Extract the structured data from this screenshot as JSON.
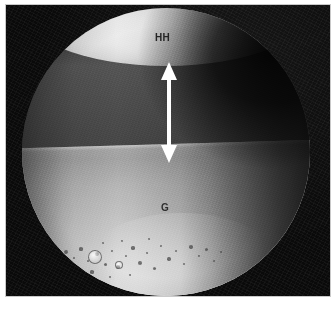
{
  "figure": {
    "type": "micrograph",
    "background_color": "#ffffff",
    "plate_color": "#0a0a0a",
    "frame_border_color": "#c9c9c9"
  },
  "field_of_view": {
    "shape": "circle",
    "center_x": 160,
    "center_y": 147,
    "diameter": 288
  },
  "labels": [
    {
      "id": "hh",
      "text": "HH",
      "x": 149,
      "y": 27,
      "color": "#242424",
      "region": "bright upper layer"
    },
    {
      "id": "g",
      "text": "G",
      "x": 155,
      "y": 197,
      "color": "#2e2e2e",
      "region": "glass substrate"
    }
  ],
  "annotations": {
    "thickness_arrow": {
      "name": "double-headed-arrow",
      "orientation": "vertical",
      "color": "#ffffff",
      "x": 163,
      "y_top": 57,
      "y_bottom": 158,
      "measures": "gap between HH layer and G substrate"
    }
  },
  "regions": [
    {
      "name": "hh-layer",
      "label": "HH",
      "tone": "bright",
      "position": "top"
    },
    {
      "name": "gap-layer",
      "label": "",
      "tone": "dark",
      "position": "middle"
    },
    {
      "name": "g-substrate",
      "label": "G",
      "tone": "light-grey",
      "position": "bottom"
    }
  ],
  "particles": [
    {
      "x": 60,
      "y": 247,
      "r": 2.0
    },
    {
      "x": 68,
      "y": 253,
      "r": 1.4
    },
    {
      "x": 75,
      "y": 244,
      "r": 1.6
    },
    {
      "x": 82,
      "y": 256,
      "r": 1.2
    },
    {
      "x": 91,
      "y": 249,
      "r": 2.2
    },
    {
      "x": 99,
      "y": 259,
      "r": 1.5
    },
    {
      "x": 106,
      "y": 246,
      "r": 1.3
    },
    {
      "x": 112,
      "y": 262,
      "r": 1.8
    },
    {
      "x": 120,
      "y": 251,
      "r": 1.1
    },
    {
      "x": 127,
      "y": 243,
      "r": 1.6
    },
    {
      "x": 134,
      "y": 258,
      "r": 2.0
    },
    {
      "x": 141,
      "y": 248,
      "r": 1.2
    },
    {
      "x": 148,
      "y": 263,
      "r": 1.5
    },
    {
      "x": 155,
      "y": 241,
      "r": 1.3
    },
    {
      "x": 163,
      "y": 254,
      "r": 1.7
    },
    {
      "x": 170,
      "y": 246,
      "r": 1.1
    },
    {
      "x": 178,
      "y": 259,
      "r": 1.4
    },
    {
      "x": 185,
      "y": 242,
      "r": 1.8
    },
    {
      "x": 193,
      "y": 251,
      "r": 1.2
    },
    {
      "x": 200,
      "y": 244,
      "r": 1.5
    },
    {
      "x": 52,
      "y": 259,
      "r": 1.3
    },
    {
      "x": 97,
      "y": 238,
      "r": 1.2
    },
    {
      "x": 116,
      "y": 236,
      "r": 1.0
    },
    {
      "x": 143,
      "y": 234,
      "r": 1.1
    },
    {
      "x": 86,
      "y": 267,
      "r": 1.6
    },
    {
      "x": 104,
      "y": 272,
      "r": 1.3
    },
    {
      "x": 124,
      "y": 270,
      "r": 1.1
    },
    {
      "x": 72,
      "y": 265,
      "r": 1.2
    },
    {
      "x": 208,
      "y": 256,
      "r": 1.0
    },
    {
      "x": 215,
      "y": 247,
      "r": 1.2
    }
  ],
  "bubbles": [
    {
      "x": 88,
      "y": 251,
      "r": 6.0
    },
    {
      "x": 112,
      "y": 259,
      "r": 3.2
    }
  ]
}
